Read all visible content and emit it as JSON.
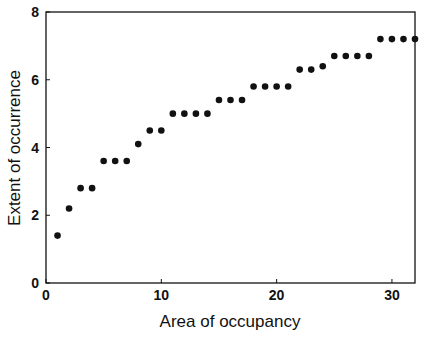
{
  "chart_data": {
    "type": "scatter",
    "title": "",
    "xlabel": "Area of occupancy",
    "ylabel": "Extent of occurrence",
    "xlim": [
      0,
      32
    ],
    "ylim": [
      0,
      8
    ],
    "grid": false,
    "legend": null,
    "x_ticks": [
      0,
      10,
      20,
      30
    ],
    "y_ticks": [
      0,
      2,
      4,
      6,
      8
    ],
    "x": [
      1,
      2,
      3,
      4,
      5,
      6,
      7,
      8,
      9,
      10,
      11,
      12,
      13,
      14,
      15,
      16,
      17,
      18,
      19,
      20,
      21,
      22,
      23,
      24,
      25,
      26,
      27,
      28,
      29,
      30,
      31,
      32
    ],
    "y": [
      1.4,
      2.2,
      2.8,
      2.8,
      3.6,
      3.6,
      3.6,
      4.1,
      4.5,
      4.5,
      5.0,
      5.0,
      5.0,
      5.0,
      5.4,
      5.4,
      5.4,
      5.8,
      5.8,
      5.8,
      5.8,
      6.3,
      6.3,
      6.4,
      6.7,
      6.7,
      6.7,
      6.7,
      7.2,
      7.2,
      7.2,
      7.2
    ],
    "marker_color": "#111111"
  }
}
